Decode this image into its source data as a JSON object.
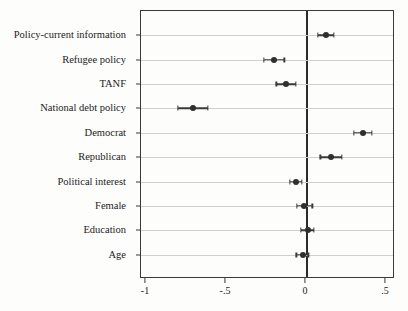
{
  "chart_data": {
    "type": "scatter",
    "subtype": "coefficient-plot",
    "title": "",
    "xlabel": "",
    "ylabel": "",
    "xlim": [
      -1.15,
      0.62
    ],
    "ylim": [
      0,
      11
    ],
    "grid": true,
    "legend": null,
    "zero_reference_line": 0,
    "xticks": [
      -1,
      -0.5,
      0,
      0.5
    ],
    "xticklabels": [
      "-1",
      "-.5",
      "0",
      ".5"
    ],
    "categories": [
      "Policy-current information",
      "Refugee policy",
      "TANF",
      "National debt policy",
      "Democrat",
      "Republican",
      "Political interest",
      "Female",
      "Education",
      "Age"
    ],
    "points": [
      {
        "label": "Policy-current information",
        "estimate": 0.125,
        "ci_low": 0.075,
        "ci_high": 0.175
      },
      {
        "label": "Refugee policy",
        "estimate": -0.2,
        "ci_low": -0.265,
        "ci_high": -0.135
      },
      {
        "label": "TANF",
        "estimate": -0.125,
        "ci_low": -0.185,
        "ci_high": -0.065
      },
      {
        "label": "National debt policy",
        "estimate": -0.706,
        "ci_low": -0.8,
        "ci_high": -0.615
      },
      {
        "label": "Democrat",
        "estimate": 0.356,
        "ci_low": 0.3,
        "ci_high": 0.41
      },
      {
        "label": "Republican",
        "estimate": 0.156,
        "ci_low": 0.09,
        "ci_high": 0.225
      },
      {
        "label": "Political interest",
        "estimate": -0.063,
        "ci_low": -0.1,
        "ci_high": -0.025
      },
      {
        "label": "Female",
        "estimate": -0.01,
        "ci_low": -0.055,
        "ci_high": 0.04
      },
      {
        "label": "Education",
        "estimate": 0.01,
        "ci_low": -0.03,
        "ci_high": 0.048
      },
      {
        "label": "Age",
        "estimate": -0.02,
        "ci_low": -0.06,
        "ci_high": 0.015
      }
    ],
    "colors": {
      "point": "#2f2f2f",
      "ci": "#3a3a3a",
      "grid": "#cfcfcf",
      "frame": "#3a3a3a",
      "zero_line": "#2b2b2b",
      "background": "#fdfdfb"
    }
  }
}
